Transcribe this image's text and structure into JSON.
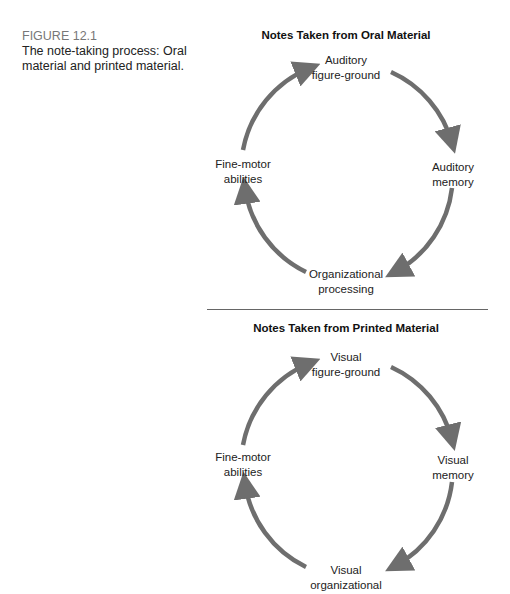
{
  "caption": {
    "figure_label": "FIGURE 12.1",
    "description": "The note-taking process: Oral material and printed material."
  },
  "colors": {
    "arrow": "#6e6e6e",
    "divider": "#666666",
    "caption_label": "#777777"
  },
  "diagrams": [
    {
      "title": "Notes Taken from Oral Material",
      "nodes": {
        "top": [
          "Auditory",
          "figure-ground"
        ],
        "right": [
          "Auditory",
          "memory"
        ],
        "bottom": [
          "Organizational",
          "processing"
        ],
        "left": [
          "Fine-motor",
          "abilities"
        ]
      }
    },
    {
      "title": "Notes Taken from Printed Material",
      "nodes": {
        "top": [
          "Visual",
          "figure-ground"
        ],
        "right": [
          "Visual",
          "memory"
        ],
        "bottom": [
          "Visual",
          "organizational"
        ],
        "left": [
          "Fine-motor",
          "abilities"
        ]
      }
    }
  ]
}
